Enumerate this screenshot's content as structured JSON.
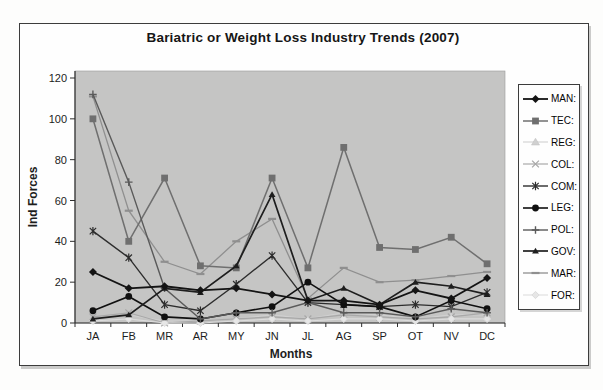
{
  "chart_data": {
    "type": "line",
    "title": "Bariatric or Weight Loss Industry Trends (2007)",
    "xlabel": "Months",
    "ylabel": "Ind Forces",
    "ylim": [
      0,
      120
    ],
    "y_ticks": [
      0,
      20,
      40,
      60,
      80,
      100,
      120
    ],
    "grid": "off",
    "legend_position": "right",
    "plot_bg": "#c5c5c4",
    "axis_color": "#2e2e2e",
    "categories": [
      "JA",
      "FB",
      "MR",
      "AR",
      "MY",
      "JN",
      "JL",
      "AG",
      "SP",
      "OT",
      "NV",
      "DC"
    ],
    "series": [
      {
        "name": "MAN:",
        "marker": "diamond",
        "color": "#141414",
        "values": [
          25,
          17,
          18,
          16,
          17,
          14,
          11,
          11,
          9,
          16,
          12,
          22
        ]
      },
      {
        "name": "TEC:",
        "marker": "square",
        "color": "#6f6f6f",
        "values": [
          100,
          40,
          71,
          28,
          27,
          71,
          27,
          86,
          37,
          36,
          42,
          29
        ]
      },
      {
        "name": "REG:",
        "marker": "triangle",
        "color": "#d0d0d0",
        "values": [
          2,
          4,
          1,
          1,
          2,
          4,
          2,
          5,
          4,
          2,
          4,
          4
        ]
      },
      {
        "name": "COL:",
        "marker": "x",
        "color": "#a8a8a8",
        "values": [
          3,
          5,
          0,
          1,
          2,
          3,
          2,
          4,
          3,
          2,
          3,
          5
        ]
      },
      {
        "name": "COM:",
        "marker": "asterisk",
        "color": "#2d2d2d",
        "values": [
          45,
          32,
          9,
          6,
          19,
          33,
          10,
          9,
          8,
          9,
          8,
          15
        ]
      },
      {
        "name": "LEG:",
        "marker": "circle",
        "color": "#101010",
        "values": [
          6,
          13,
          3,
          2,
          5,
          8,
          20,
          9,
          8,
          3,
          11,
          7
        ]
      },
      {
        "name": "POL:",
        "marker": "plus",
        "color": "#5a5a5a",
        "values": [
          112,
          69,
          17,
          2,
          5,
          5,
          10,
          5,
          5,
          3,
          7,
          5
        ]
      },
      {
        "name": "GOV:",
        "marker": "triangle-small",
        "color": "#1e1e1e",
        "values": [
          2,
          4,
          17,
          15,
          28,
          63,
          11,
          17,
          9,
          20,
          18,
          14
        ]
      },
      {
        "name": "MAR:",
        "marker": "dash",
        "color": "#8f8f8f",
        "values": [
          111,
          55,
          30,
          24,
          40,
          51,
          12,
          27,
          20,
          21,
          23,
          25
        ]
      },
      {
        "name": "FOR:",
        "marker": "diamond-open",
        "color": "#dcdcdc",
        "values": [
          1,
          2,
          0,
          0,
          1,
          2,
          1,
          2,
          2,
          1,
          2,
          2
        ]
      }
    ]
  }
}
